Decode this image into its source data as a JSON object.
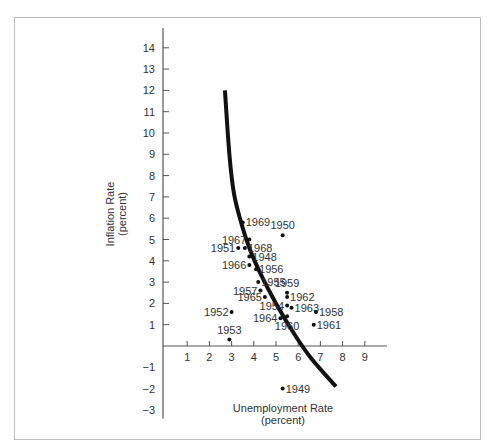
{
  "chart_data": {
    "type": "scatter",
    "title": "",
    "xlabel": "Unemployment Rate",
    "xlabel_unit": "(percent)",
    "ylabel": "Inflation Rate",
    "ylabel_unit": "(percent)",
    "xlim": [
      0,
      10
    ],
    "ylim": [
      -3,
      15
    ],
    "x_ticks": [
      "1",
      "2",
      "3",
      "4",
      "5",
      "6",
      "7",
      "8",
      "9"
    ],
    "y_ticks": [
      "14",
      "13",
      "12",
      "11",
      "10",
      "9",
      "8",
      "7",
      "6",
      "5",
      "4",
      "3",
      "2",
      "1",
      "−1",
      "−2",
      "−3"
    ],
    "grid": false,
    "points": [
      {
        "label": "1969",
        "x": 3.5,
        "y": 5.8,
        "side": "right"
      },
      {
        "label": "1950",
        "x": 5.3,
        "y": 5.2,
        "side": "top"
      },
      {
        "label": "1967",
        "x": 3.8,
        "y": 5.0,
        "side": "left"
      },
      {
        "label": "1951",
        "x": 3.3,
        "y": 4.6,
        "side": "left"
      },
      {
        "label": "1968",
        "x": 3.6,
        "y": 4.6,
        "side": "right"
      },
      {
        "label": "1948",
        "x": 3.8,
        "y": 4.2,
        "side": "right"
      },
      {
        "label": "1966",
        "x": 3.8,
        "y": 3.8,
        "side": "left"
      },
      {
        "label": "1956",
        "x": 4.1,
        "y": 3.6,
        "side": "right"
      },
      {
        "label": "1955",
        "x": 4.2,
        "y": 3.0,
        "side": "right"
      },
      {
        "label": "1957",
        "x": 4.3,
        "y": 2.6,
        "side": "left"
      },
      {
        "label": "1965",
        "x": 4.5,
        "y": 2.3,
        "side": "left"
      },
      {
        "label": "1959",
        "x": 5.5,
        "y": 2.5,
        "side": "top"
      },
      {
        "label": "1962",
        "x": 5.5,
        "y": 2.3,
        "side": "right"
      },
      {
        "label": "1954",
        "x": 5.5,
        "y": 1.9,
        "side": "left"
      },
      {
        "label": "1963",
        "x": 5.7,
        "y": 1.8,
        "side": "right"
      },
      {
        "label": "1958",
        "x": 6.8,
        "y": 1.6,
        "side": "right"
      },
      {
        "label": "1952",
        "x": 3.0,
        "y": 1.6,
        "side": "left"
      },
      {
        "label": "1964",
        "x": 5.2,
        "y": 1.3,
        "side": "left"
      },
      {
        "label": "1960",
        "x": 5.5,
        "y": 1.4,
        "side": "bottom"
      },
      {
        "label": "1961",
        "x": 6.7,
        "y": 1.0,
        "side": "right"
      },
      {
        "label": "1953",
        "x": 2.9,
        "y": 0.3,
        "side": "top"
      },
      {
        "label": "1949",
        "x": 5.3,
        "y": -2.0,
        "side": "right"
      }
    ],
    "curve": {
      "name": "Phillips curve",
      "points": [
        [
          2.7,
          12.0
        ],
        [
          2.9,
          9.0
        ],
        [
          3.1,
          7.2
        ],
        [
          3.4,
          5.9
        ],
        [
          3.8,
          4.6
        ],
        [
          4.3,
          3.4
        ],
        [
          5.0,
          2.0
        ],
        [
          5.8,
          0.6
        ],
        [
          6.6,
          -0.6
        ],
        [
          7.7,
          -1.9
        ]
      ]
    }
  }
}
